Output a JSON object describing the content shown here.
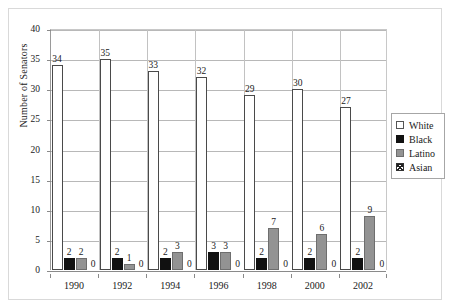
{
  "chart_data": {
    "type": "bar",
    "title": "",
    "subtitle": "",
    "xlabel": "",
    "ylabel": "Number of Senators",
    "categories": [
      "1990",
      "1992",
      "1994",
      "1996",
      "1998",
      "2000",
      "2002"
    ],
    "ylim": [
      0,
      40
    ],
    "ytick_step": 5,
    "yticks": [
      "0",
      "5",
      "10",
      "15",
      "20",
      "25",
      "30",
      "35",
      "40"
    ],
    "grid": true,
    "grid_axis": "y",
    "legend_position": "right",
    "series": [
      {
        "name": "White",
        "color": "#ffffff",
        "edge": "#4a4a4a",
        "values": [
          34,
          35,
          33,
          32,
          29,
          30,
          27
        ],
        "labels": [
          "34",
          "35",
          "33",
          "32",
          "29",
          "30",
          "27"
        ]
      },
      {
        "name": "Black",
        "color": "#111111",
        "edge": "#111111",
        "values": [
          2,
          2,
          2,
          3,
          2,
          2,
          2
        ],
        "labels": [
          "2",
          "2",
          "2",
          "3",
          "2",
          "2",
          "2"
        ]
      },
      {
        "name": "Latino",
        "color": "#939393",
        "edge": "#6e6e6e",
        "values": [
          2,
          1,
          3,
          3,
          7,
          6,
          9
        ],
        "labels": [
          "2",
          "1",
          "3",
          "3",
          "7",
          "6",
          "9"
        ]
      },
      {
        "name": "Asian",
        "color": "#ffffff",
        "edge": "#4a4a4a",
        "values": [
          0,
          0,
          0,
          0,
          0,
          0,
          0
        ],
        "labels": [
          "0",
          "0",
          "0",
          "0",
          "0",
          "0",
          "0"
        ]
      }
    ]
  },
  "axis": {
    "y_title": "Number of Senators",
    "y_ticks": [
      "40",
      "35",
      "30",
      "25",
      "20",
      "15",
      "10",
      "5",
      "0"
    ],
    "x_ticks": [
      "1990",
      "1992",
      "1994",
      "1996",
      "1998",
      "2000",
      "2002"
    ]
  },
  "legend": {
    "items": [
      {
        "label": "White",
        "swatch": "white-swatch"
      },
      {
        "label": "Black",
        "swatch": "black-swatch"
      },
      {
        "label": "Latino",
        "swatch": "latino-swatch"
      },
      {
        "label": "Asian",
        "swatch": "asian-hatch-swatch"
      }
    ]
  }
}
